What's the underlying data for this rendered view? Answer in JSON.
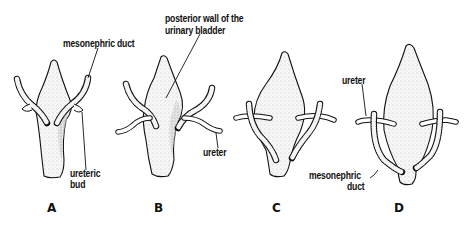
{
  "figure": {
    "panels": [
      {
        "id": "A",
        "letter": "A"
      },
      {
        "id": "B",
        "letter": "B"
      },
      {
        "id": "C",
        "letter": "C"
      },
      {
        "id": "D",
        "letter": "D"
      }
    ],
    "labels": {
      "a_mesonephric_duct": "mesonephric duct",
      "a_ureteric_bud_line1": "ureteric",
      "a_ureteric_bud_line2": "bud",
      "b_posterior_wall_line1": "posterior wall of the",
      "b_posterior_wall_line2": "urinary bladder",
      "b_ureter": "ureter",
      "d_ureter": "ureter",
      "d_mesonephric_line1": "mesonephric",
      "d_mesonephric_line2": "duct"
    },
    "colors": {
      "ink": "#111111",
      "stipple": "#9a9a9a",
      "fill": "#f2f2f2",
      "background": "#ffffff"
    }
  }
}
